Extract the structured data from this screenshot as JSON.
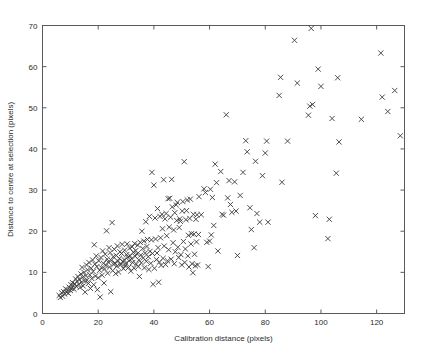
{
  "figure": {
    "width": 423,
    "height": 353,
    "background": "#ffffff",
    "marker_color": "#3a3a3a",
    "axis_color": "#5a5a5a"
  },
  "chart_data": {
    "type": "scatter",
    "title": "",
    "xlabel": "Calibration distance (pixels)",
    "ylabel": "Distance to centre at selection (pixels)",
    "xlim": [
      0,
      130
    ],
    "ylim": [
      0,
      70
    ],
    "xticks": [
      0,
      20,
      40,
      60,
      80,
      100,
      120
    ],
    "yticks": [
      0,
      10,
      20,
      30,
      40,
      50,
      60,
      70
    ],
    "xticklabels": [
      "0",
      "20",
      "40",
      "60",
      "80",
      "100",
      "120"
    ],
    "yticklabels": [
      "0",
      "10",
      "20",
      "30",
      "40",
      "50",
      "60",
      "70"
    ],
    "grid": false,
    "legend": null,
    "marker": "x",
    "series": [
      {
        "name": "selections",
        "points": [
          [
            6.0,
            4.4
          ],
          [
            6.4,
            3.9
          ],
          [
            6.9,
            5.0
          ],
          [
            7.2,
            4.2
          ],
          [
            7.6,
            5.3
          ],
          [
            8.0,
            4.7
          ],
          [
            8.3,
            6.0
          ],
          [
            8.6,
            5.2
          ],
          [
            9.0,
            5.7
          ],
          [
            9.3,
            4.9
          ],
          [
            9.6,
            6.4
          ],
          [
            10.0,
            5.6
          ],
          [
            10.2,
            7.0
          ],
          [
            10.5,
            6.1
          ],
          [
            10.8,
            7.5
          ],
          [
            11.0,
            6.8
          ],
          [
            11.3,
            5.9
          ],
          [
            11.6,
            7.2
          ],
          [
            11.9,
            8.4
          ],
          [
            12.1,
            6.6
          ],
          [
            12.4,
            7.8
          ],
          [
            12.7,
            9.0
          ],
          [
            13.0,
            7.1
          ],
          [
            13.2,
            8.3
          ],
          [
            13.5,
            6.3
          ],
          [
            13.8,
            9.6
          ],
          [
            14.0,
            7.6
          ],
          [
            14.2,
            11.2
          ],
          [
            14.4,
            8.8
          ],
          [
            14.6,
            6.7
          ],
          [
            14.9,
            10.0
          ],
          [
            15.1,
            7.9
          ],
          [
            15.3,
            5.2
          ],
          [
            15.6,
            9.2
          ],
          [
            15.8,
            11.8
          ],
          [
            16.0,
            8.1
          ],
          [
            16.2,
            10.6
          ],
          [
            16.5,
            7.3
          ],
          [
            16.7,
            12.4
          ],
          [
            17.0,
            9.4
          ],
          [
            17.2,
            6.1
          ],
          [
            17.5,
            11.0
          ],
          [
            17.7,
            8.5
          ],
          [
            18.0,
            13.0
          ],
          [
            18.2,
            10.2
          ],
          [
            18.4,
            7.0
          ],
          [
            18.6,
            16.7
          ],
          [
            18.8,
            12.0
          ],
          [
            19.0,
            9.1
          ],
          [
            19.3,
            14.0
          ],
          [
            19.5,
            11.4
          ],
          [
            19.7,
            5.8
          ],
          [
            20.0,
            8.7
          ],
          [
            20.2,
            12.8
          ],
          [
            20.5,
            10.5
          ],
          [
            20.7,
            4.0
          ],
          [
            21.0,
            13.6
          ],
          [
            21.2,
            11.1
          ],
          [
            21.4,
            9.3
          ],
          [
            21.6,
            15.2
          ],
          [
            21.9,
            12.2
          ],
          [
            22.1,
            7.4
          ],
          [
            22.3,
            10.8
          ],
          [
            22.5,
            14.4
          ],
          [
            22.8,
            11.7
          ],
          [
            23.0,
            20.1
          ],
          [
            23.2,
            13.2
          ],
          [
            23.4,
            9.8
          ],
          [
            23.6,
            12.5
          ],
          [
            23.9,
            16.0
          ],
          [
            24.1,
            11.3
          ],
          [
            24.3,
            14.8
          ],
          [
            24.5,
            5.3
          ],
          [
            24.7,
            12.9
          ],
          [
            25.0,
            22.1
          ],
          [
            25.2,
            10.4
          ],
          [
            25.4,
            13.8
          ],
          [
            25.6,
            11.9
          ],
          [
            25.8,
            15.6
          ],
          [
            26.0,
            12.3
          ],
          [
            26.3,
            9.7
          ],
          [
            26.5,
            14.1
          ],
          [
            26.7,
            11.5
          ],
          [
            26.9,
            16.4
          ],
          [
            27.1,
            12.7
          ],
          [
            27.3,
            10.1
          ],
          [
            27.6,
            13.4
          ],
          [
            27.8,
            15.0
          ],
          [
            28.0,
            11.8
          ],
          [
            28.2,
            12.1
          ],
          [
            28.4,
            14.6
          ],
          [
            28.6,
            16.8
          ],
          [
            28.9,
            12.6
          ],
          [
            29.1,
            10.9
          ],
          [
            29.3,
            13.1
          ],
          [
            29.5,
            15.4
          ],
          [
            29.7,
            11.6
          ],
          [
            30.0,
            12.2
          ],
          [
            30.2,
            14.3
          ],
          [
            30.4,
            16.9
          ],
          [
            30.6,
            13.7
          ],
          [
            30.9,
            11.2
          ],
          [
            31.1,
            12.8
          ],
          [
            31.3,
            15.9
          ],
          [
            31.5,
            14.0
          ],
          [
            31.7,
            10.3
          ],
          [
            32.0,
            13.3
          ],
          [
            32.2,
            16.2
          ],
          [
            32.4,
            12.4
          ],
          [
            32.6,
            14.9
          ],
          [
            32.9,
            11.0
          ],
          [
            33.1,
            17.0
          ],
          [
            33.3,
            13.9
          ],
          [
            33.5,
            15.3
          ],
          [
            33.7,
            12.0
          ],
          [
            34.0,
            14.5
          ],
          [
            34.2,
            16.6
          ],
          [
            34.4,
            11.4
          ],
          [
            34.6,
            13.0
          ],
          [
            34.8,
            9.0
          ],
          [
            35.1,
            17.3
          ],
          [
            35.3,
            14.2
          ],
          [
            35.5,
            12.3
          ],
          [
            35.7,
            20.0
          ],
          [
            36.0,
            15.8
          ],
          [
            36.2,
            13.5
          ],
          [
            36.4,
            17.6
          ],
          [
            36.6,
            11.1
          ],
          [
            36.9,
            14.7
          ],
          [
            37.1,
            22.3
          ],
          [
            37.3,
            12.7
          ],
          [
            37.5,
            16.3
          ],
          [
            37.7,
            18.0
          ],
          [
            38.0,
            13.8
          ],
          [
            38.2,
            10.7
          ],
          [
            38.4,
            23.6
          ],
          [
            38.6,
            15.1
          ],
          [
            38.9,
            12.2
          ],
          [
            39.1,
            17.9
          ],
          [
            39.3,
            34.3
          ],
          [
            39.5,
            14.6
          ],
          [
            39.7,
            7.1
          ],
          [
            40.0,
            31.2
          ],
          [
            40.2,
            11.0
          ],
          [
            40.4,
            23.2
          ],
          [
            40.6,
            18.1
          ],
          [
            40.9,
            13.1
          ],
          [
            41.1,
            14.7
          ],
          [
            41.3,
            25.5
          ],
          [
            41.5,
            16.0
          ],
          [
            41.7,
            7.6
          ],
          [
            42.0,
            12.5
          ],
          [
            42.2,
            23.6
          ],
          [
            42.4,
            18.4
          ],
          [
            42.6,
            11.7
          ],
          [
            42.9,
            24.1
          ],
          [
            43.1,
            20.6
          ],
          [
            43.3,
            13.4
          ],
          [
            43.5,
            32.5
          ],
          [
            43.7,
            16.4
          ],
          [
            44.0,
            23.0
          ],
          [
            44.2,
            11.9
          ],
          [
            44.4,
            24.3
          ],
          [
            44.6,
            18.9
          ],
          [
            44.9,
            12.8
          ],
          [
            45.1,
            27.9
          ],
          [
            45.3,
            15.5
          ],
          [
            45.5,
            21.0
          ],
          [
            45.7,
            28.0
          ],
          [
            46.0,
            23.4
          ],
          [
            46.2,
            13.2
          ],
          [
            46.4,
            32.6
          ],
          [
            46.6,
            25.9
          ],
          [
            46.9,
            17.2
          ],
          [
            47.1,
            20.3
          ],
          [
            47.3,
            12.1
          ],
          [
            47.5,
            24.5
          ],
          [
            47.7,
            15.0
          ],
          [
            48.0,
            26.4
          ],
          [
            48.2,
            22.6
          ],
          [
            48.4,
            27.0
          ],
          [
            48.6,
            16.1
          ],
          [
            48.9,
            13.6
          ],
          [
            49.1,
            20.9
          ],
          [
            49.3,
            23.0
          ],
          [
            49.5,
            22.4
          ],
          [
            49.7,
            14.3
          ],
          [
            50.0,
            11.8
          ],
          [
            50.2,
            24.9
          ],
          [
            50.4,
            27.2
          ],
          [
            50.6,
            17.5
          ],
          [
            50.9,
            36.9
          ],
          [
            51.1,
            12.4
          ],
          [
            51.3,
            15.7
          ],
          [
            51.5,
            22.8
          ],
          [
            51.7,
            25.0
          ],
          [
            52.0,
            27.6
          ],
          [
            52.2,
            14.0
          ],
          [
            52.4,
            19.0
          ],
          [
            52.6,
            11.3
          ],
          [
            52.9,
            23.1
          ],
          [
            53.1,
            27.8
          ],
          [
            53.3,
            16.9
          ],
          [
            53.5,
            19.4
          ],
          [
            53.7,
            12.1
          ],
          [
            54.0,
            9.9
          ],
          [
            54.2,
            24.1
          ],
          [
            54.4,
            19.3
          ],
          [
            54.6,
            14.4
          ],
          [
            54.9,
            11.6
          ],
          [
            55.1,
            22.9
          ],
          [
            55.3,
            17.4
          ],
          [
            55.5,
            24.0
          ],
          [
            55.7,
            11.8
          ],
          [
            56.0,
            19.2
          ],
          [
            56.2,
            28.4
          ],
          [
            57.0,
            24.0
          ],
          [
            58.0,
            30.3
          ],
          [
            58.5,
            29.4
          ],
          [
            59.0,
            17.3
          ],
          [
            59.5,
            11.4
          ],
          [
            60.0,
            17.6
          ],
          [
            60.3,
            30.2
          ],
          [
            60.6,
            19.1
          ],
          [
            61.0,
            28.2
          ],
          [
            61.5,
            21.4
          ],
          [
            62.0,
            36.3
          ],
          [
            62.5,
            31.8
          ],
          [
            63.0,
            15.2
          ],
          [
            64.0,
            34.5
          ],
          [
            64.5,
            24.1
          ],
          [
            65.0,
            23.9
          ],
          [
            66.0,
            48.3
          ],
          [
            66.5,
            28.1
          ],
          [
            67.0,
            32.3
          ],
          [
            67.5,
            26.5
          ],
          [
            68.0,
            24.6
          ],
          [
            69.0,
            32.0
          ],
          [
            69.5,
            24.9
          ],
          [
            70.0,
            14.1
          ],
          [
            71.0,
            28.7
          ],
          [
            72.0,
            34.3
          ],
          [
            73.0,
            42.0
          ],
          [
            73.5,
            39.3
          ],
          [
            74.5,
            25.7
          ],
          [
            75.0,
            20.4
          ],
          [
            76.0,
            16.0
          ],
          [
            76.5,
            37.0
          ],
          [
            77.0,
            24.3
          ],
          [
            78.0,
            22.2
          ],
          [
            79.0,
            33.5
          ],
          [
            80.0,
            39.0
          ],
          [
            80.5,
            41.9
          ],
          [
            81.0,
            22.2
          ],
          [
            85.0,
            53.0
          ],
          [
            85.5,
            57.4
          ],
          [
            86.0,
            31.9
          ],
          [
            88.0,
            41.9
          ],
          [
            90.5,
            66.4
          ],
          [
            91.5,
            56.0
          ],
          [
            95.5,
            48.2
          ],
          [
            96.0,
            50.4
          ],
          [
            96.5,
            69.3
          ],
          [
            97.0,
            50.8
          ],
          [
            98.0,
            23.8
          ],
          [
            99.0,
            59.4
          ],
          [
            100.0,
            55.2
          ],
          [
            102.5,
            18.2
          ],
          [
            103.0,
            22.9
          ],
          [
            104.0,
            47.4
          ],
          [
            105.5,
            34.1
          ],
          [
            106.0,
            57.3
          ],
          [
            106.5,
            41.7
          ],
          [
            114.5,
            47.2
          ],
          [
            121.5,
            63.3
          ],
          [
            122.0,
            52.6
          ],
          [
            124.0,
            49.1
          ],
          [
            126.5,
            54.2
          ],
          [
            128.5,
            43.2
          ]
        ]
      }
    ]
  }
}
